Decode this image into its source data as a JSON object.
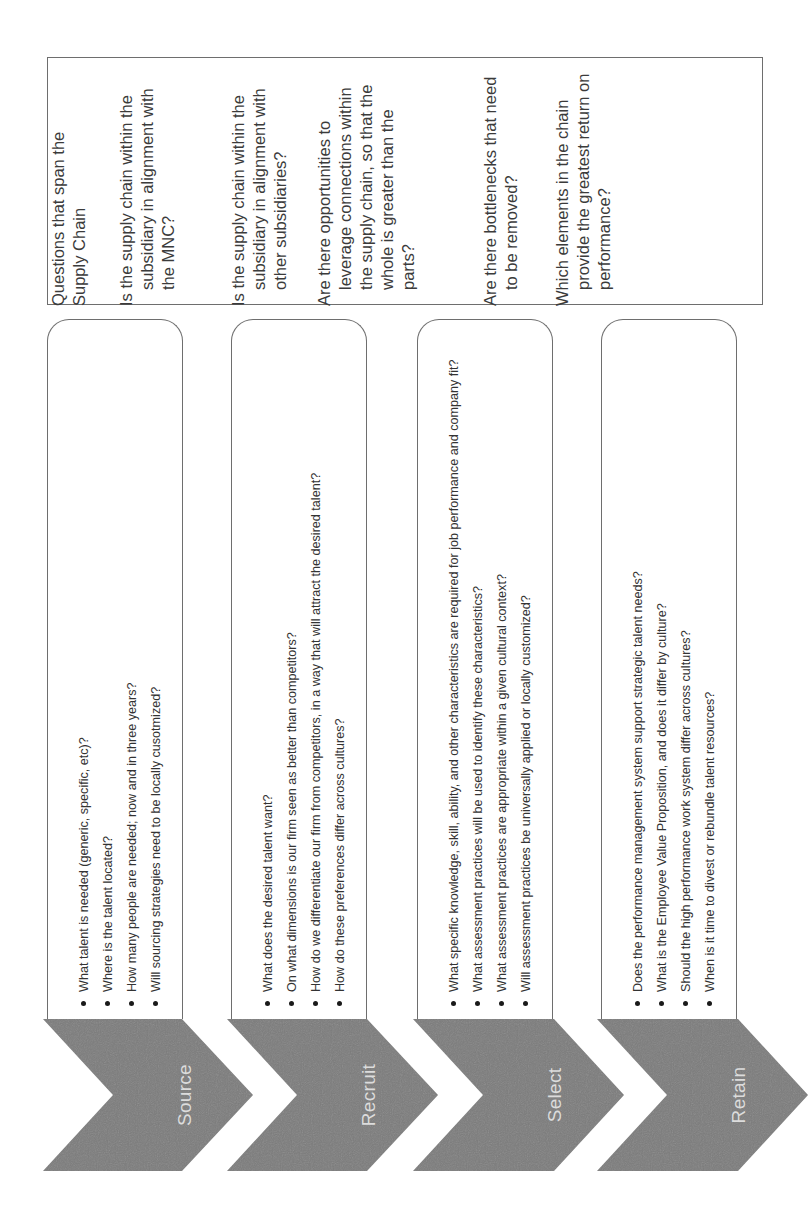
{
  "supply_chain_box": {
    "title": "Questions that span the Supply Chain",
    "questions": [
      "Is the supply chain within the subsidiary in alignment with the MNC?",
      "Is the supply chain within the subsidiary in alignment with other subsidiaries?",
      "Are there opportunities to leverage connections within the supply chain, so that the whole is greater than the parts?",
      "Are there bottlenecks that need to be removed?",
      "Which elements in the chain provide the greatest return on performance?"
    ]
  },
  "stages": [
    {
      "label": "Source",
      "questions": [
        "What talent is needed (generic, specific, etc)?",
        "Where is the talent located?",
        "How many people are needed; now and in three years?",
        "Will sourcing strategies need to be locally cusotmized?"
      ]
    },
    {
      "label": "Recruit",
      "questions": [
        "What does the desired talent want?",
        "On what dimensions is our firm seen as better than competitors?",
        "How do we differentiate our firm from competitors, in a way that will attract the desired talent?",
        "How do these preferences differ across cultures?"
      ]
    },
    {
      "label": "Select",
      "questions": [
        "What specific knowledge, skill, ability, and other characteristics are required for job performance and company fit?",
        "What assessment practices will be used to identify these characteristics?",
        "What assessment practices are appropriate within a given cultural context?",
        "Will assessment practices be universally applied or locally customized?"
      ]
    },
    {
      "label": "Retain",
      "questions": [
        "Does the performance management system support strategic talent needs?",
        "What is the Employee Value Proposition, and does it differ by culture?",
        "Should the high performance work system differ across cultures?",
        "When is it time to divest or rebundle talent resources?"
      ]
    }
  ],
  "colors": {
    "chevron_fill": "#7b7b7b",
    "chevron_text": "#dcdcdc",
    "border": "#6e6e6e",
    "text": "#3a3a3a"
  }
}
